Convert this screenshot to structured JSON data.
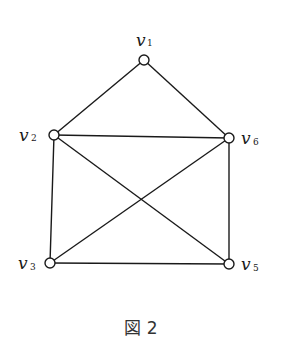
{
  "figure": {
    "caption": "図 2",
    "nodes": [
      {
        "id": "v1",
        "letter": "v",
        "sub": "1",
        "x": 144,
        "y": 60,
        "lx": 136,
        "ly": 46,
        "sx": 147,
        "sy": 46
      },
      {
        "id": "v2",
        "letter": "v",
        "sub": "2",
        "x": 54,
        "y": 135,
        "lx": 19,
        "ly": 141,
        "sx": 31,
        "sy": 141
      },
      {
        "id": "v3",
        "letter": "v",
        "sub": "3",
        "x": 50,
        "y": 263,
        "lx": 18,
        "ly": 269,
        "sx": 30,
        "sy": 270
      },
      {
        "id": "v5",
        "letter": "v",
        "sub": "5",
        "x": 229,
        "y": 264,
        "lx": 241,
        "ly": 270,
        "sx": 253,
        "sy": 271
      },
      {
        "id": "v6",
        "letter": "v",
        "sub": "6",
        "x": 229,
        "y": 138,
        "lx": 241,
        "ly": 144,
        "sx": 253,
        "sy": 145
      }
    ],
    "edges": [
      [
        "v1",
        "v2"
      ],
      [
        "v1",
        "v6"
      ],
      [
        "v2",
        "v6"
      ],
      [
        "v2",
        "v3"
      ],
      [
        "v2",
        "v5"
      ],
      [
        "v6",
        "v3"
      ],
      [
        "v6",
        "v5"
      ],
      [
        "v3",
        "v5"
      ]
    ]
  }
}
